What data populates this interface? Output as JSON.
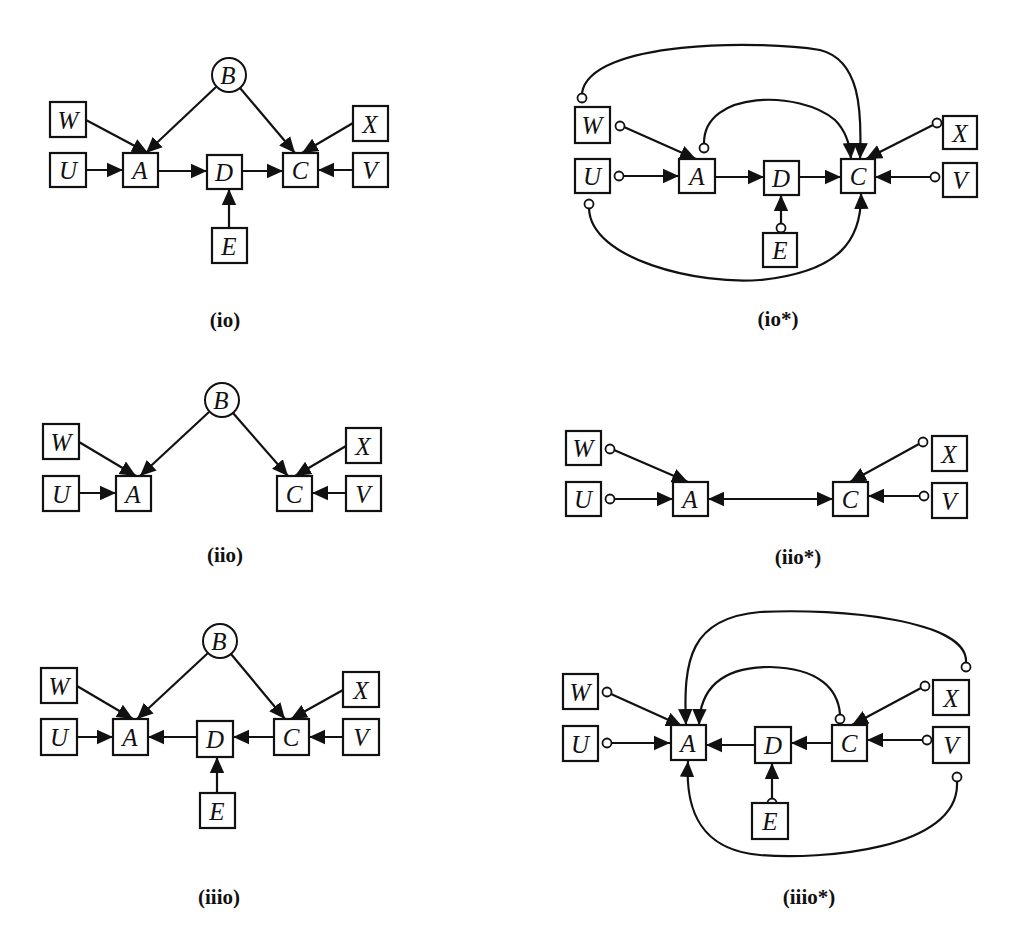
{
  "figure": {
    "panels": [
      {
        "id": "io",
        "label": "(io)",
        "nodes": {
          "B": "B",
          "W": "W",
          "U": "U",
          "A": "A",
          "D": "D",
          "C": "C",
          "X": "X",
          "V": "V",
          "E": "E"
        },
        "edges": [
          {
            "from": "W",
            "to": "A",
            "type": "directed"
          },
          {
            "from": "U",
            "to": "A",
            "type": "directed"
          },
          {
            "from": "B",
            "to": "A",
            "type": "directed"
          },
          {
            "from": "B",
            "to": "C",
            "type": "directed"
          },
          {
            "from": "A",
            "to": "D",
            "type": "directed"
          },
          {
            "from": "D",
            "to": "C",
            "type": "directed"
          },
          {
            "from": "E",
            "to": "D",
            "type": "directed"
          },
          {
            "from": "X",
            "to": "C",
            "type": "directed"
          },
          {
            "from": "V",
            "to": "C",
            "type": "directed"
          }
        ]
      },
      {
        "id": "io_star",
        "label": "(io*)",
        "nodes": {
          "W": "W",
          "U": "U",
          "A": "A",
          "D": "D",
          "C": "C",
          "X": "X",
          "V": "V",
          "E": "E"
        },
        "edges": [
          {
            "from": "W",
            "to": "A",
            "type": "circle-arrow"
          },
          {
            "from": "U",
            "to": "A",
            "type": "circle-arrow"
          },
          {
            "from": "A",
            "to": "D",
            "type": "directed"
          },
          {
            "from": "D",
            "to": "C",
            "type": "directed"
          },
          {
            "from": "E",
            "to": "D",
            "type": "circle-arrow"
          },
          {
            "from": "X",
            "to": "C",
            "type": "circle-arrow"
          },
          {
            "from": "V",
            "to": "C",
            "type": "circle-arrow"
          },
          {
            "from": "W",
            "to": "C",
            "type": "circle-arrow",
            "curved": true
          },
          {
            "from": "A",
            "to": "C",
            "type": "circle-arrow",
            "curved": true
          },
          {
            "from": "U",
            "to": "C",
            "type": "circle-arrow",
            "curved": true
          }
        ]
      },
      {
        "id": "iio",
        "label": "(iio)",
        "nodes": {
          "B": "B",
          "W": "W",
          "U": "U",
          "A": "A",
          "C": "C",
          "X": "X",
          "V": "V"
        },
        "edges": [
          {
            "from": "W",
            "to": "A",
            "type": "directed"
          },
          {
            "from": "U",
            "to": "A",
            "type": "directed"
          },
          {
            "from": "B",
            "to": "A",
            "type": "directed"
          },
          {
            "from": "B",
            "to": "C",
            "type": "directed"
          },
          {
            "from": "X",
            "to": "C",
            "type": "directed"
          },
          {
            "from": "V",
            "to": "C",
            "type": "directed"
          }
        ]
      },
      {
        "id": "iio_star",
        "label": "(iio*)",
        "nodes": {
          "W": "W",
          "U": "U",
          "A": "A",
          "C": "C",
          "X": "X",
          "V": "V"
        },
        "edges": [
          {
            "from": "W",
            "to": "A",
            "type": "circle-arrow"
          },
          {
            "from": "U",
            "to": "A",
            "type": "circle-arrow"
          },
          {
            "from": "A",
            "to": "C",
            "type": "bidirected"
          },
          {
            "from": "X",
            "to": "C",
            "type": "circle-arrow"
          },
          {
            "from": "V",
            "to": "C",
            "type": "circle-arrow"
          }
        ]
      },
      {
        "id": "iiio",
        "label": "(iiio)",
        "nodes": {
          "B": "B",
          "W": "W",
          "U": "U",
          "A": "A",
          "D": "D",
          "C": "C",
          "X": "X",
          "V": "V",
          "E": "E"
        },
        "edges": [
          {
            "from": "W",
            "to": "A",
            "type": "directed"
          },
          {
            "from": "U",
            "to": "A",
            "type": "directed"
          },
          {
            "from": "B",
            "to": "A",
            "type": "directed"
          },
          {
            "from": "B",
            "to": "C",
            "type": "directed"
          },
          {
            "from": "D",
            "to": "A",
            "type": "directed"
          },
          {
            "from": "C",
            "to": "D",
            "type": "directed"
          },
          {
            "from": "E",
            "to": "D",
            "type": "directed"
          },
          {
            "from": "X",
            "to": "C",
            "type": "directed"
          },
          {
            "from": "V",
            "to": "C",
            "type": "directed"
          }
        ]
      },
      {
        "id": "iiio_star",
        "label": "(iiio*)",
        "nodes": {
          "W": "W",
          "U": "U",
          "A": "A",
          "D": "D",
          "C": "C",
          "X": "X",
          "V": "V",
          "E": "E"
        },
        "edges": [
          {
            "from": "W",
            "to": "A",
            "type": "circle-arrow"
          },
          {
            "from": "U",
            "to": "A",
            "type": "circle-arrow"
          },
          {
            "from": "D",
            "to": "A",
            "type": "directed"
          },
          {
            "from": "C",
            "to": "D",
            "type": "directed"
          },
          {
            "from": "E",
            "to": "D",
            "type": "circle-arrow"
          },
          {
            "from": "X",
            "to": "C",
            "type": "circle-arrow"
          },
          {
            "from": "V",
            "to": "C",
            "type": "circle-arrow"
          },
          {
            "from": "X",
            "to": "A",
            "type": "circle-arrow",
            "curved": true
          },
          {
            "from": "C",
            "to": "A",
            "type": "circle-arrow",
            "curved": true
          },
          {
            "from": "V",
            "to": "A",
            "type": "circle-arrow",
            "curved": true
          }
        ]
      }
    ]
  }
}
